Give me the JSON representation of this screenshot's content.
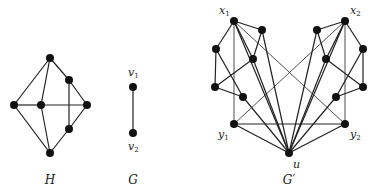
{
  "figure": {
    "graphs": [
      {
        "id": "H",
        "caption": "H",
        "caption_pos": [
          50,
          184
        ],
        "nodes": [
          {
            "id": "t",
            "x": 50,
            "y": 58
          },
          {
            "id": "l",
            "x": 14,
            "y": 105
          },
          {
            "id": "c",
            "x": 41,
            "y": 105
          },
          {
            "id": "r",
            "x": 87,
            "y": 105
          },
          {
            "id": "b",
            "x": 50,
            "y": 153
          },
          {
            "id": "ur",
            "x": 69,
            "y": 80
          },
          {
            "id": "lr",
            "x": 69,
            "y": 129
          }
        ],
        "edges": [
          [
            "t",
            "l"
          ],
          [
            "t",
            "c"
          ],
          [
            "t",
            "ur"
          ],
          [
            "ur",
            "r"
          ],
          [
            "ur",
            "lr"
          ],
          [
            "l",
            "c"
          ],
          [
            "c",
            "r"
          ],
          [
            "l",
            "b"
          ],
          [
            "c",
            "b"
          ],
          [
            "b",
            "lr"
          ],
          [
            "lr",
            "r"
          ]
        ]
      },
      {
        "id": "G",
        "caption": "G",
        "caption_pos": [
          133,
          184
        ],
        "nodes": [
          {
            "id": "v1",
            "x": 133,
            "y": 87,
            "label": "v",
            "sub": "1",
            "label_pos": [
              128,
              76
            ]
          },
          {
            "id": "v2",
            "x": 133,
            "y": 133,
            "label": "v",
            "sub": "2",
            "label_pos": [
              128,
              150
            ]
          }
        ],
        "edges": [
          [
            "v1",
            "v2"
          ]
        ]
      },
      {
        "id": "Gprime",
        "caption": "G′",
        "caption_pos": [
          289,
          184
        ],
        "nodes": [
          {
            "id": "x1",
            "x": 234,
            "y": 21,
            "label": "x",
            "sub": "1",
            "label_pos": [
              219,
              14
            ]
          },
          {
            "id": "a1",
            "x": 262,
            "y": 30
          },
          {
            "id": "b1",
            "x": 216,
            "y": 49
          },
          {
            "id": "c1",
            "x": 253,
            "y": 59
          },
          {
            "id": "d1",
            "x": 215,
            "y": 87
          },
          {
            "id": "e1",
            "x": 243,
            "y": 97
          },
          {
            "id": "y1",
            "x": 234,
            "y": 124,
            "label": "y",
            "sub": "1",
            "label_pos": [
              218,
              138
            ]
          },
          {
            "id": "x2",
            "x": 345,
            "y": 21,
            "label": "x",
            "sub": "2",
            "label_pos": [
              350,
              14
            ]
          },
          {
            "id": "a2",
            "x": 317,
            "y": 30
          },
          {
            "id": "b2",
            "x": 363,
            "y": 49
          },
          {
            "id": "c2",
            "x": 326,
            "y": 59
          },
          {
            "id": "d2",
            "x": 363,
            "y": 87
          },
          {
            "id": "e2",
            "x": 336,
            "y": 97
          },
          {
            "id": "y2",
            "x": 345,
            "y": 124,
            "label": "y",
            "sub": "2",
            "label_pos": [
              350,
              138
            ]
          },
          {
            "id": "u",
            "x": 289,
            "y": 153,
            "label": "u",
            "sub": "",
            "label_pos": [
              293,
              168
            ]
          }
        ],
        "edges": [
          [
            "x1",
            "a1"
          ],
          [
            "x1",
            "b1"
          ],
          [
            "x1",
            "c1"
          ],
          [
            "a1",
            "c1"
          ],
          [
            "c1",
            "d1"
          ],
          [
            "b1",
            "d1"
          ],
          [
            "b1",
            "e1"
          ],
          [
            "d1",
            "e1"
          ],
          [
            "x1",
            "u"
          ],
          [
            "a1",
            "u"
          ],
          [
            "c1",
            "u"
          ],
          [
            "e1",
            "u"
          ],
          [
            "x2",
            "a2"
          ],
          [
            "x2",
            "b2"
          ],
          [
            "x2",
            "c2"
          ],
          [
            "a2",
            "c2"
          ],
          [
            "c2",
            "d2"
          ],
          [
            "b2",
            "d2"
          ],
          [
            "b2",
            "e2"
          ],
          [
            "d2",
            "e2"
          ],
          [
            "x2",
            "u"
          ],
          [
            "a2",
            "u"
          ],
          [
            "c2",
            "u"
          ],
          [
            "e2",
            "u"
          ],
          [
            "y1",
            "u"
          ],
          [
            "y2",
            "u"
          ],
          [
            "y1",
            "y2"
          ]
        ],
        "thin_edges": [
          [
            "x1",
            "y1"
          ],
          [
            "x2",
            "y2"
          ],
          [
            "x1",
            "y2"
          ],
          [
            "x2",
            "y1"
          ]
        ]
      }
    ],
    "style": {
      "node_color": "#111111",
      "edge_color": "#222222",
      "node_radius": 4
    }
  }
}
